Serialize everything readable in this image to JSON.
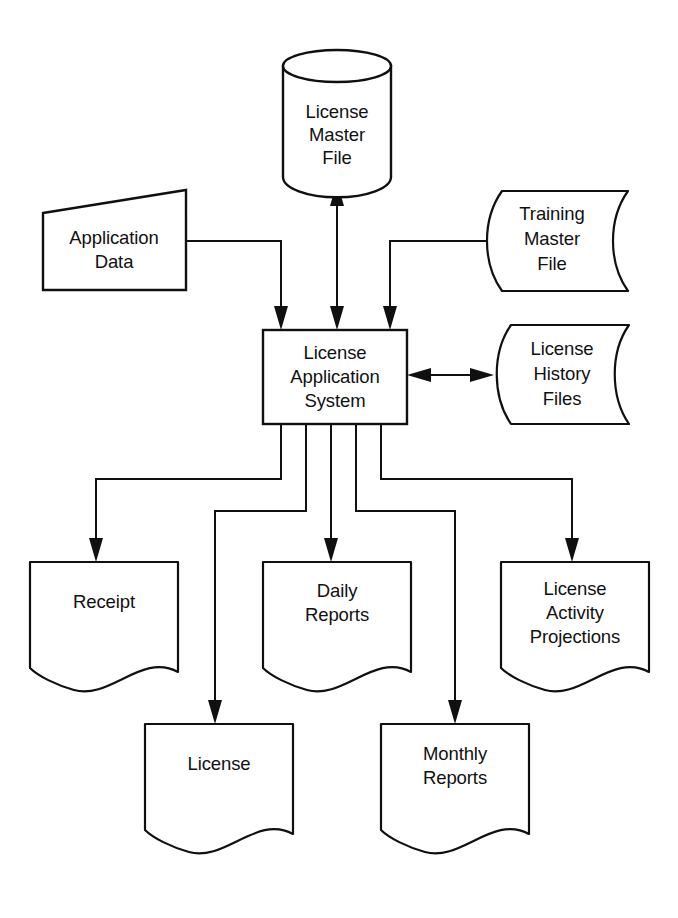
{
  "diagram": {
    "type": "system-flowchart",
    "background_color": "#ffffff",
    "line_color": "#101010",
    "nodes": [
      {
        "id": "license-master-file",
        "shape": "cylinder",
        "role": "storage",
        "lines": [
          "License",
          "Master",
          "File"
        ]
      },
      {
        "id": "application-data",
        "shape": "trapezoid",
        "role": "manual-input",
        "lines": [
          "Application",
          "Data"
        ]
      },
      {
        "id": "training-master-file",
        "shape": "magnetic-tape",
        "role": "storage",
        "lines": [
          "Training",
          "Master",
          "File"
        ]
      },
      {
        "id": "license-application-system",
        "shape": "rectangle",
        "role": "process",
        "lines": [
          "License",
          "Application",
          "System"
        ]
      },
      {
        "id": "license-history-files",
        "shape": "magnetic-tape",
        "role": "storage",
        "lines": [
          "License",
          "History",
          "Files"
        ]
      },
      {
        "id": "receipt",
        "shape": "document",
        "role": "output",
        "lines": [
          "Receipt"
        ]
      },
      {
        "id": "daily-reports",
        "shape": "document",
        "role": "output",
        "lines": [
          "Daily",
          "Reports"
        ]
      },
      {
        "id": "license-activity-projections",
        "shape": "document",
        "role": "output",
        "lines": [
          "License",
          "Activity",
          "Projections"
        ]
      },
      {
        "id": "license",
        "shape": "document",
        "role": "output",
        "lines": [
          "License"
        ]
      },
      {
        "id": "monthly-reports",
        "shape": "document",
        "role": "output",
        "lines": [
          "Monthly",
          "Reports"
        ]
      }
    ],
    "connections": [
      {
        "from": "application-data",
        "to": "license-application-system",
        "direction": "one-way"
      },
      {
        "from": "license-master-file",
        "to": "license-application-system",
        "direction": "two-way"
      },
      {
        "from": "training-master-file",
        "to": "license-application-system",
        "direction": "one-way"
      },
      {
        "from": "license-application-system",
        "to": "license-history-files",
        "direction": "two-way"
      },
      {
        "from": "license-application-system",
        "to": "receipt",
        "direction": "one-way"
      },
      {
        "from": "license-application-system",
        "to": "license",
        "direction": "one-way"
      },
      {
        "from": "license-application-system",
        "to": "daily-reports",
        "direction": "one-way"
      },
      {
        "from": "license-application-system",
        "to": "monthly-reports",
        "direction": "one-way"
      },
      {
        "from": "license-application-system",
        "to": "license-activity-projections",
        "direction": "one-way"
      }
    ]
  }
}
